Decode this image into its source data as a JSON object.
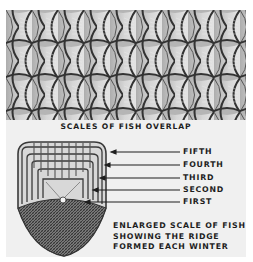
{
  "figure": {
    "top_caption": "SCALES OF FISH OVERLAP",
    "ridge_labels": [
      {
        "label": "FIFTH",
        "y": 151
      },
      {
        "label": "FOURTH",
        "y": 164
      },
      {
        "label": "THIRD",
        "y": 177
      },
      {
        "label": "SECOND",
        "y": 189
      },
      {
        "label": "FIRST",
        "y": 201
      }
    ],
    "description_lines": [
      "ENLARGED SCALE OF FISH",
      "SHOWING THE RIDGE",
      "FORMED EACH WINTER"
    ]
  },
  "colors": {
    "panel_bg": "#f0f0f0",
    "scale_fill": "#c4c4c4",
    "scale_edge": "#3a3a3a",
    "text": "#1e1e1e"
  }
}
